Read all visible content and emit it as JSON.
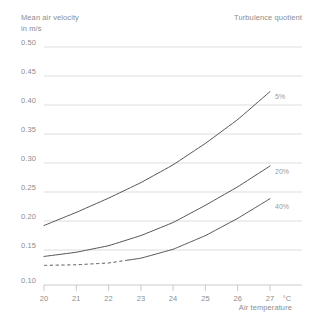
{
  "header": {
    "y_axis_title": "Mean air velocity\nin m/s",
    "legend_title": "Turbulence quotient"
  },
  "axes": {
    "x_axis_title": "Air temperature",
    "x_unit": "°C",
    "y_ticks": [
      "0.50",
      "0.45",
      "0.40",
      "0.35",
      "0.30",
      "0.25",
      "0.20",
      "0.15",
      "0.10"
    ],
    "x_ticks": [
      "20",
      "21",
      "22",
      "23",
      "24",
      "25",
      "26",
      "27"
    ]
  },
  "series_labels": {
    "s5": "5%",
    "s20": "20%",
    "s40": "40%"
  },
  "colors": {
    "curve": "#55555c",
    "grid": "#cfcfcf",
    "axis": "#b4b4b4",
    "text": "#8d8d8d",
    "series_text": "#9a9a9a",
    "background": "#ffffff"
  },
  "chart_data": {
    "type": "line",
    "xlabel": "Air temperature",
    "ylabel": "Mean air velocity in m/s",
    "x_unit": "°C",
    "xlim": [
      20,
      27
    ],
    "ylim": [
      0.1,
      0.5
    ],
    "grid": true,
    "legend_title": "Turbulence quotient",
    "legend_position": "curve-end-labels",
    "x": [
      20,
      21,
      22,
      23,
      24,
      25,
      26,
      27
    ],
    "series": [
      {
        "name": "5%",
        "values": [
          0.2,
          0.222,
          0.246,
          0.272,
          0.302,
          0.338,
          0.378,
          0.425
        ],
        "dashed_from": null,
        "dashed_to": null
      },
      {
        "name": "20%",
        "values": [
          0.148,
          0.155,
          0.166,
          0.183,
          0.205,
          0.234,
          0.265,
          0.3
        ],
        "dashed_from": null,
        "dashed_to": null
      },
      {
        "name": "40%",
        "values": [
          0.133,
          0.134,
          0.137,
          0.145,
          0.16,
          0.183,
          0.212,
          0.245
        ],
        "dashed_from": 20,
        "dashed_to": 22.6
      }
    ]
  }
}
